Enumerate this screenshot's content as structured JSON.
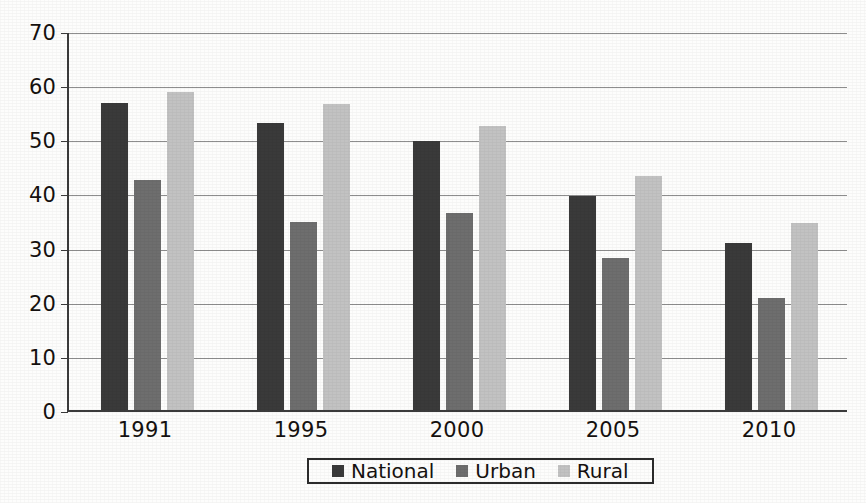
{
  "chart_data": {
    "type": "bar",
    "title": "",
    "subtitle": "",
    "xlabel": "",
    "ylabel": "",
    "categories": [
      "1991",
      "1995",
      "2000",
      "2005",
      "2010"
    ],
    "series": [
      {
        "name": "National",
        "color": "#3a3a3a",
        "values": [
          56.7,
          53.0,
          49.6,
          39.6,
          30.8
        ]
      },
      {
        "name": "Urban",
        "color": "#6e6e6e",
        "values": [
          42.5,
          34.8,
          36.3,
          28.0,
          20.6
        ]
      },
      {
        "name": "Rural",
        "color": "#c2c2c2",
        "values": [
          58.7,
          56.5,
          52.5,
          43.3,
          34.5
        ]
      }
    ],
    "ylim": [
      0,
      70
    ],
    "ytick_step": 10,
    "yticks": [
      "0",
      "10",
      "20",
      "30",
      "40",
      "50",
      "60",
      "70"
    ],
    "grid": true,
    "grid_axis": "y",
    "legend_position": "bottom-center",
    "legend_border": true,
    "background": "#fdfdfc",
    "axis_color": "#3b3b3b",
    "gridline_color": "#8e8e8e",
    "text_color": "#15110f"
  },
  "legend": {
    "items": [
      {
        "label": "National"
      },
      {
        "label": "Urban"
      },
      {
        "label": "Rural"
      }
    ]
  }
}
